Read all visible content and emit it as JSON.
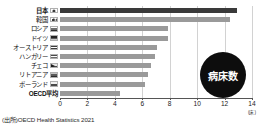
{
  "badge": {
    "label": "病床数"
  },
  "source": {
    "text": "(出所)OECD Health Statistics 2021"
  },
  "axis": {
    "unit_label": "(床)",
    "ticks": [
      "0",
      "2",
      "4",
      "6",
      "8",
      "10",
      "12",
      "14"
    ]
  },
  "chart_data": {
    "type": "bar",
    "orientation": "horizontal",
    "title": "病床数",
    "xlabel": "(床)",
    "ylabel": "",
    "xlim": [
      0,
      14
    ],
    "grid": true,
    "legend": "none",
    "categories": [
      "日本",
      "韓国",
      "ロシア",
      "ドイツ",
      "オーストリア",
      "ハンガリー",
      "チェコ",
      "リトアニア",
      "ポーランド",
      "OECD平均"
    ],
    "values": [
      12.9,
      12.4,
      7.9,
      7.9,
      7.1,
      6.9,
      6.6,
      6.4,
      6.2,
      4.4
    ],
    "flags": [
      "flag-jp",
      "flag-kr",
      "flag-ru",
      "flag-de",
      "flag-at",
      "flag-hu",
      "flag-cz",
      "flag-lt",
      "flag-pl",
      "none"
    ],
    "highlight_index": 0,
    "bold_labels": [
      "日本",
      "OECD平均"
    ],
    "colors": {
      "bar": "#9a9a9a",
      "bar_highlight": "#3a3a3a",
      "badge": "#0d0d0d"
    }
  }
}
